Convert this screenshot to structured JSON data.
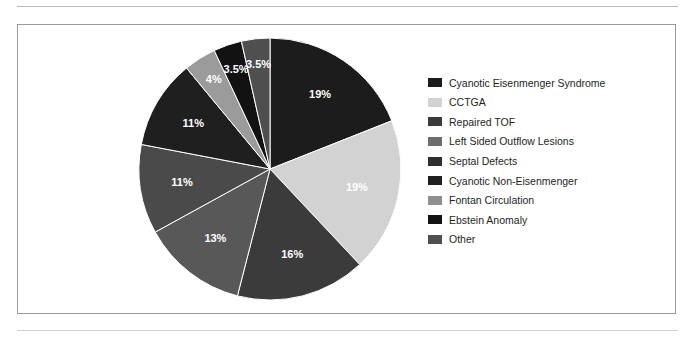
{
  "figure": {
    "background": "#ffffff",
    "border_color": "#9a9a9a",
    "rule_color": "#b8b8b8"
  },
  "chart_data": {
    "type": "pie",
    "title": "",
    "xlabel": "",
    "ylabel": "",
    "legend_position": "right",
    "grid": false,
    "start_angle_deg": 0,
    "direction": "clockwise",
    "categories": [
      "Cyanotic Eisenmenger Syndrome",
      "CCTGA",
      "Repaired TOF",
      "Left Sided Outflow Lesions",
      "Septal Defects",
      "Cyanotic Non-Eisenmenger",
      "Fontan Circulation",
      "Ebstein Anomaly",
      "Other"
    ],
    "values": [
      19,
      19,
      16,
      13,
      11,
      11,
      4,
      3.5,
      3.5
    ],
    "labels": [
      "19%",
      "19%",
      "16%",
      "13%",
      "11%",
      "11%",
      "4%",
      "3.5%",
      "3.5%"
    ],
    "colors": [
      "#1c1c1c",
      "#d2d2d2",
      "#3b3b3b",
      "#585858",
      "#4a4a4a",
      "#1f1f1f",
      "#9b9b9b",
      "#121212",
      "#4f4f4f"
    ],
    "label_color": "#ffffff",
    "slice_border_color": "#ffffff"
  },
  "legend": {
    "items": [
      {
        "label": "Cyanotic Eisenmenger Syndrome",
        "color": "#1c1c1c"
      },
      {
        "label": "CCTGA",
        "color": "#d2d2d2"
      },
      {
        "label": "Repaired TOF",
        "color": "#3b3b3b"
      },
      {
        "label": "Left Sided Outflow Lesions",
        "color": "#6d6d6d"
      },
      {
        "label": "Septal Defects",
        "color": "#2e2e2e"
      },
      {
        "label": "Cyanotic Non-Eisenmenger",
        "color": "#1f1f1f"
      },
      {
        "label": "Fontan Circulation",
        "color": "#8f8f8f"
      },
      {
        "label": "Ebstein Anomaly",
        "color": "#121212"
      },
      {
        "label": "Other",
        "color": "#4f4f4f"
      }
    ]
  }
}
